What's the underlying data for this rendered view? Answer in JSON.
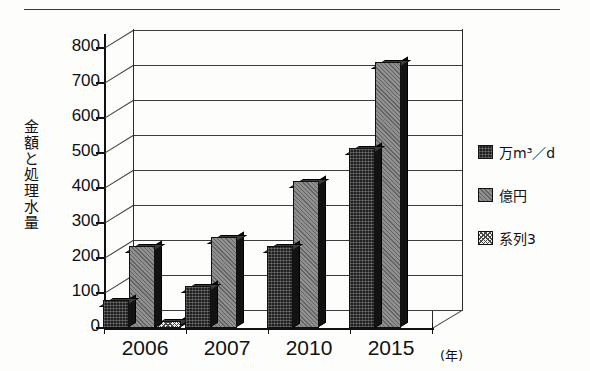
{
  "page": {
    "clipped_header_text": "",
    "top_rule": "horizontal-rule"
  },
  "chart_data": {
    "type": "bar",
    "title": "",
    "subtitle": "",
    "xlabel": "(年)",
    "ylabel": "金額と処理水量",
    "categories": [
      "2006",
      "2007",
      "2010",
      "2015"
    ],
    "series": [
      {
        "name": "万m3/d",
        "name_display": "万m",
        "unit_sup": "3",
        "unit_tail": "／d",
        "fill": "dark-crosshatch",
        "color": "#202020",
        "values": [
          75,
          115,
          230,
          510
        ]
      },
      {
        "name": "億円",
        "fill": "gray-diagonal",
        "color": "#8f8f8f",
        "values": [
          230,
          255,
          415,
          755
        ]
      },
      {
        "name": "系列3",
        "fill": "light-dotted",
        "color": "#f2f2f2",
        "values": [
          15,
          0,
          0,
          0
        ]
      }
    ],
    "ylim": [
      0,
      800
    ],
    "ytick_step": 100,
    "yticks": [
      "0",
      "100",
      "200",
      "300",
      "400",
      "500",
      "600",
      "700",
      "800"
    ],
    "grid": true,
    "grid_style": "horizontal-3d",
    "legend_position": "right",
    "projection": "3d-column"
  },
  "legend": {
    "items": [
      {
        "label": "万m³／d",
        "swatch": "dark-crosshatch"
      },
      {
        "label": "億円",
        "swatch": "gray-diagonal"
      },
      {
        "label": "系列3",
        "swatch": "light-dotted"
      }
    ]
  },
  "axes": {
    "x_unit_label": "(年)",
    "y_title": "金額と処理水量"
  }
}
